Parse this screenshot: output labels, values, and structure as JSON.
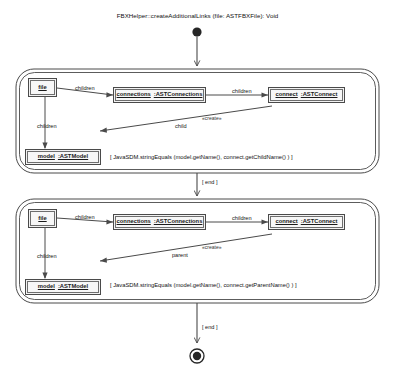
{
  "diagram": {
    "title": "FBXHelper::createAdditionalLinks (file: ASTFBXFile): Void",
    "kind": "story-diagram"
  },
  "nodes": {
    "initial": {
      "name": "initial-node"
    },
    "final": {
      "name": "final-node"
    }
  },
  "activities": [
    {
      "id": "activity-1",
      "objects": [
        {
          "id": "file-1",
          "name": "file",
          "type": ":ASTFBXFile"
        },
        {
          "id": "connections-1",
          "name": "connections",
          "type": ":ASTConnections"
        },
        {
          "id": "connect-1",
          "name": "connect",
          "type": ":ASTConnect"
        },
        {
          "id": "model-1",
          "name": "model",
          "type": ":ASTModel"
        }
      ],
      "links": [
        {
          "id": "link-file-connections-1",
          "label": "children"
        },
        {
          "id": "link-connections-connect-1",
          "label": "children"
        },
        {
          "id": "link-file-model-1",
          "label": "children"
        },
        {
          "id": "link-create-child-1",
          "label": "child",
          "stereotype": "«create»"
        }
      ],
      "guard": "[ JavaSDM.stringEquals (model.getName(), connect.getChildName() ) ]"
    },
    {
      "id": "activity-2",
      "objects": [
        {
          "id": "file-2",
          "name": "file",
          "type": ":ASTFBXFile"
        },
        {
          "id": "connections-2",
          "name": "connections",
          "type": ":ASTConnections"
        },
        {
          "id": "connect-2",
          "name": "connect",
          "type": ":ASTConnect"
        },
        {
          "id": "model-2",
          "name": "model",
          "type": ":ASTModel"
        }
      ],
      "links": [
        {
          "id": "link-file-connections-2",
          "label": "children"
        },
        {
          "id": "link-connections-connect-2",
          "label": "children"
        },
        {
          "id": "link-file-model-2",
          "label": "children"
        },
        {
          "id": "link-create-parent-2",
          "label": "parent",
          "stereotype": "«create»"
        }
      ],
      "guard": "[ JavaSDM.stringEquals (model.getName(), connect.getParentName() ) ]"
    }
  ],
  "transitions": [
    {
      "id": "transition-1",
      "label": "[ end ]"
    },
    {
      "id": "transition-2",
      "label": "[ end ]"
    }
  ],
  "colors": {
    "line": "#4a4a4a",
    "node_fill": "#f2f2f2",
    "text": "#111111"
  }
}
